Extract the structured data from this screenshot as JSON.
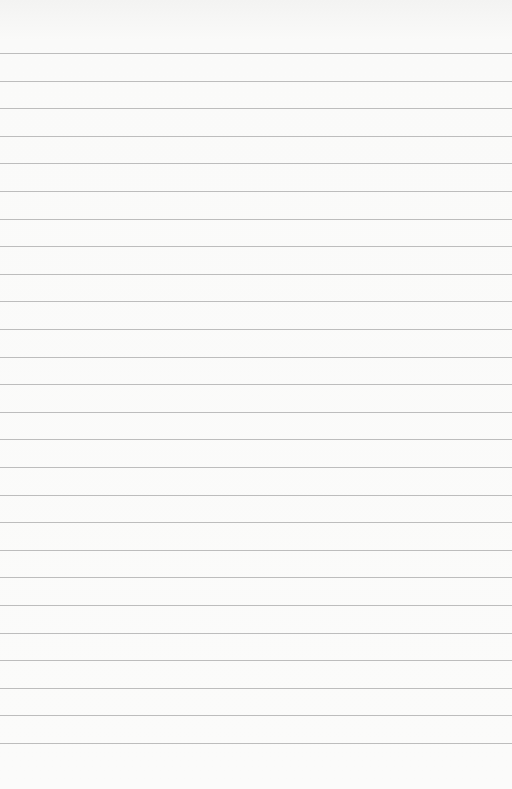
{
  "paper": {
    "type": "lined-paper",
    "line_color": "#bdbdbd",
    "background": "#fbfbfa",
    "first_line_y": 53,
    "line_spacing": 27.6,
    "line_count": 26
  }
}
